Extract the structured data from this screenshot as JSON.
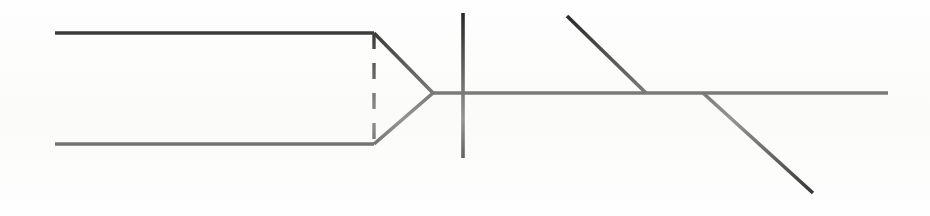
{
  "figure": {
    "width": 930,
    "height": 216,
    "background_color": "#fefefe",
    "ink_color": "#1a1a1a",
    "line_weight_px": 3.4
  },
  "chart_data": {
    "type": "line",
    "xlabel": "",
    "ylabel": "",
    "xlim": [
      0,
      930
    ],
    "ylim": [
      0,
      216
    ],
    "grid": false,
    "legend": "none",
    "coordinate_note": "Pixel coordinates, origin at top-left of the 930x216 image.",
    "series": [
      {
        "name": "upper-channel-line",
        "style": "solid",
        "stroke": "#1a1a1a",
        "width": 3.6,
        "x": [
          55,
          374
        ],
        "y": [
          33,
          33
        ]
      },
      {
        "name": "lower-channel-line",
        "style": "solid",
        "stroke": "#1a1a1a",
        "width": 3.6,
        "x": [
          55,
          374
        ],
        "y": [
          144,
          144
        ]
      },
      {
        "name": "dashed-closure-line",
        "style": "dashed",
        "stroke": "#1a1a1a",
        "width": 3.4,
        "dash_pattern": "16 14",
        "x": [
          374,
          374
        ],
        "y": [
          33,
          144
        ]
      },
      {
        "name": "arrowhead-upper-edge",
        "style": "solid",
        "stroke": "#1a1a1a",
        "width": 3.6,
        "x": [
          374,
          433
        ],
        "y": [
          33,
          93
        ]
      },
      {
        "name": "arrowhead-lower-edge",
        "style": "solid",
        "stroke": "#1a1a1a",
        "width": 3.6,
        "x": [
          374,
          433
        ],
        "y": [
          144,
          93
        ]
      },
      {
        "name": "main-horizontal-axis",
        "style": "solid",
        "stroke": "#1a1a1a",
        "width": 3.6,
        "x": [
          433,
          888
        ],
        "y": [
          93,
          93
        ]
      },
      {
        "name": "vertical-crossbar",
        "style": "solid",
        "stroke": "#1a1a1a",
        "width": 3.6,
        "x": [
          463,
          463
        ],
        "y": [
          13,
          158
        ]
      },
      {
        "name": "upper-left-diagonal-branch",
        "style": "solid",
        "stroke": "#1a1a1a",
        "width": 3.6,
        "x": [
          567,
          646
        ],
        "y": [
          16,
          93
        ]
      },
      {
        "name": "lower-right-diagonal-branch",
        "style": "solid",
        "stroke": "#1a1a1a",
        "width": 3.6,
        "x": [
          703,
          813
        ],
        "y": [
          93,
          193
        ]
      }
    ],
    "annotations": [],
    "tick_labels": {
      "x": [],
      "y": []
    }
  }
}
